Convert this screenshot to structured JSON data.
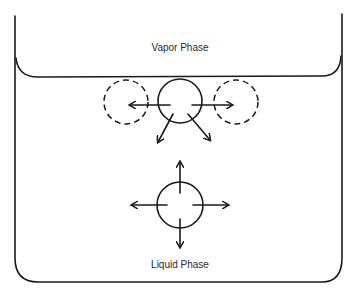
{
  "diagram": {
    "labels": {
      "vapor": "Vapor Phase",
      "liquid": "Liquid Phase"
    },
    "surface_molecule": {
      "forces": [
        "left",
        "right",
        "down-left",
        "down-right"
      ],
      "neighbors_shown_dashed": [
        "left",
        "right"
      ]
    },
    "bulk_molecule": {
      "forces": [
        "up",
        "down",
        "left",
        "right"
      ]
    }
  }
}
